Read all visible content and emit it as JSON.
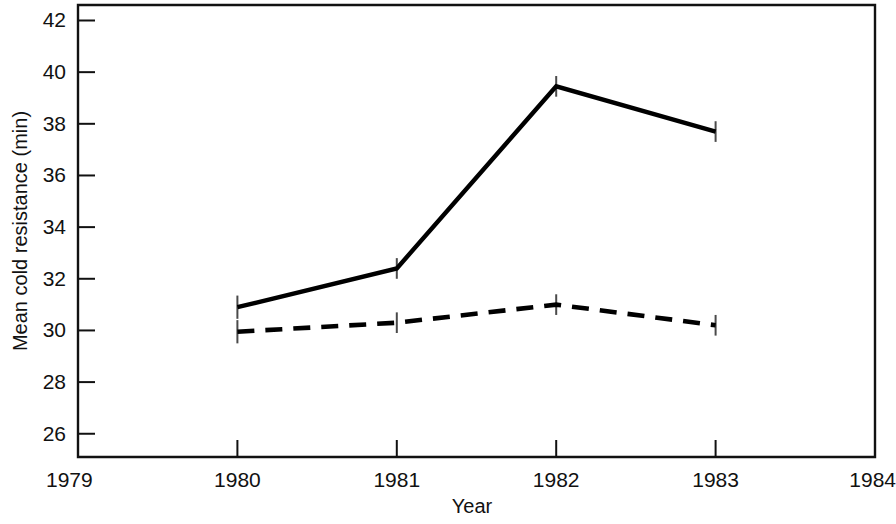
{
  "chart_data": {
    "type": "line",
    "title": "",
    "subtitle": "",
    "xlabel": "Year",
    "ylabel": "Mean cold resistance (min)",
    "x": [
      1980,
      1981,
      1982,
      1983
    ],
    "xlim": [
      1979,
      1984
    ],
    "ylim": [
      25.1,
      42.6
    ],
    "xticks": [
      1979,
      1980,
      1981,
      1982,
      1983,
      1984
    ],
    "xtick_labels": [
      "1979",
      "1980",
      "1981",
      "1982",
      "1983",
      "1984"
    ],
    "yticks": [
      26,
      28,
      30,
      32,
      34,
      36,
      38,
      40,
      42
    ],
    "ytick_labels": [
      "26",
      "28",
      "30",
      "32",
      "34",
      "36",
      "38",
      "40",
      "42"
    ],
    "grid": false,
    "legend": "none",
    "series": [
      {
        "name": "solid-line-series",
        "style": "solid",
        "values": [
          30.9,
          32.4,
          39.45,
          37.7
        ],
        "errors": [
          0.45,
          0.4,
          0.4,
          0.4
        ]
      },
      {
        "name": "dashed-line-series",
        "style": "dashed",
        "values": [
          29.95,
          30.3,
          31.0,
          30.2
        ],
        "errors": [
          0.45,
          0.4,
          0.4,
          0.4
        ]
      }
    ],
    "annotations": []
  },
  "axes": {
    "y_axis_title": "Mean cold resistance (min)",
    "x_axis_title": "Year"
  }
}
